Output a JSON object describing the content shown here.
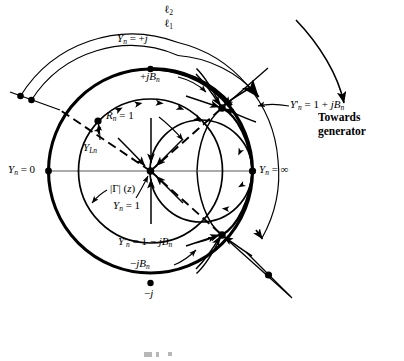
{
  "figure": {
    "type": "smith-chart-admittance-diagram",
    "title": "",
    "geometry": {
      "outer_circle": {
        "cx": 150.5,
        "cy": 171,
        "r": 102
      },
      "gamma_circle": {
        "cx": 150.5,
        "cy": 171,
        "r": 72
      },
      "rn1_circle": {
        "cx": 201,
        "cy": 171,
        "r": 51
      },
      "upper_intersection": {
        "x": 222,
        "y": 108
      },
      "lower_intersection": {
        "x": 222,
        "y": 235
      },
      "center_point": {
        "x": 150.5,
        "y": 171
      },
      "load_point_YLn": {
        "x": 98,
        "y": 121
      },
      "arc_l1_radius": 118,
      "arc_l2_radius": 131
    },
    "labels": {
      "l2": "ℓ₂",
      "l1": "ℓ₁",
      "yn_plus_j": "Yₙ = +j",
      "yn_minus_j": "−j",
      "yn_zero": "Yₙ = 0",
      "yn_infinity": "Yₙ = ∞",
      "yn_one": "Yₙ = 1",
      "rn_one": "Rₙ = 1",
      "gamma_z": "|Γ| (z)",
      "y_load": "Y_Lₙ",
      "yprime_plus": "Y'ₙ = 1 + jBₙ",
      "yprime_minus": "Y'ₙ = 1 − jBₙ",
      "plus_jbn": "+jBₙ",
      "minus_jbn": "−jBₙ",
      "towards_generator_line1": "Towards",
      "towards_generator_line2": "generator"
    },
    "colors": {
      "ink": "#000000",
      "background": "#ffffff",
      "axis_gray": "#8f8f8f"
    }
  }
}
